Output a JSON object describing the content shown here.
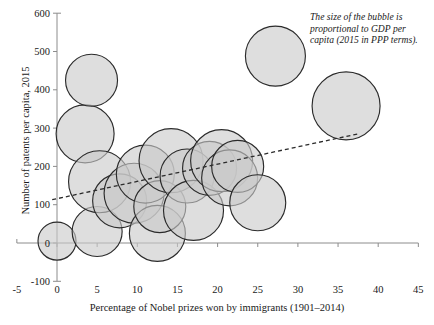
{
  "chart_data": {
    "type": "scatter",
    "title": "",
    "xlabel": "Percentage of Nobel prizes won by immigrants (1901–2014)",
    "ylabel": "Number of patents per capita, 2015",
    "xlim": [
      -5,
      45
    ],
    "ylim": [
      -100,
      600
    ],
    "xticks": [
      "-5",
      "0",
      "5",
      "10",
      "15",
      "20",
      "25",
      "30",
      "35",
      "40",
      "45"
    ],
    "yticks": [
      "600",
      "500",
      "400",
      "300",
      "200",
      "100",
      "0",
      "-100"
    ],
    "xtick_values": [
      -5,
      0,
      5,
      10,
      15,
      20,
      25,
      30,
      35,
      40,
      45
    ],
    "ytick_values": [
      600,
      500,
      400,
      300,
      200,
      100,
      0,
      -100
    ],
    "grid": false,
    "legend": "none",
    "annotation": "The size of the bubble is proportional to GDP per capita (2015 in PPP terms).",
    "size_encoding": "bubble area proportional to GDP per capita (2015, PPP)",
    "bubble_fill": "#c9c9c9",
    "bubble_stroke": "#2b2b2b",
    "axis_color": "#8c8c8c",
    "trendline": {
      "style": "dashed",
      "x_start": -0.6,
      "y_start": 113,
      "x_end": 37.5,
      "y_end": 285
    },
    "points": [
      {
        "x": 0.0,
        "y": 5,
        "r_px": 19
      },
      {
        "x": 3.5,
        "y": 285,
        "r_px": 29
      },
      {
        "x": 4.3,
        "y": 425,
        "r_px": 26
      },
      {
        "x": 5.0,
        "y": 30,
        "r_px": 25
      },
      {
        "x": 5.3,
        "y": 160,
        "r_px": 31
      },
      {
        "x": 7.8,
        "y": 110,
        "r_px": 27
      },
      {
        "x": 9.6,
        "y": 130,
        "r_px": 30
      },
      {
        "x": 11.0,
        "y": 180,
        "r_px": 29
      },
      {
        "x": 12.5,
        "y": 25,
        "r_px": 28
      },
      {
        "x": 12.8,
        "y": 95,
        "r_px": 26
      },
      {
        "x": 14.2,
        "y": 215,
        "r_px": 32
      },
      {
        "x": 16.2,
        "y": 175,
        "r_px": 27
      },
      {
        "x": 17.0,
        "y": 85,
        "r_px": 30
      },
      {
        "x": 19.0,
        "y": 195,
        "r_px": 27
      },
      {
        "x": 20.5,
        "y": 215,
        "r_px": 31
      },
      {
        "x": 21.5,
        "y": 170,
        "r_px": 28
      },
      {
        "x": 22.5,
        "y": 200,
        "r_px": 26
      },
      {
        "x": 25.0,
        "y": 105,
        "r_px": 28
      },
      {
        "x": 27.2,
        "y": 488,
        "r_px": 30
      },
      {
        "x": 36.0,
        "y": 358,
        "r_px": 34
      }
    ]
  },
  "annotation": {
    "text": "The size of the bubble is proportional to GDP per capita (2015 in PPP terms)."
  },
  "axes": {
    "x_title": "Percentage of Nobel prizes won by immigrants (1901–2014)",
    "y_title": "Number of patents per capita, 2015"
  },
  "title": {
    "text": ""
  }
}
